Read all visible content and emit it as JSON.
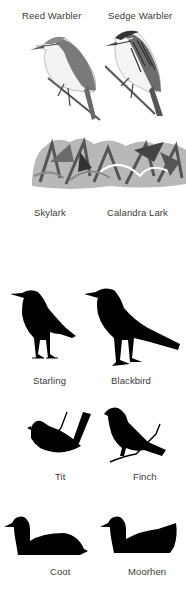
{
  "sections": [
    {
      "id": "warblers",
      "birds": [
        {
          "name": "Reed Warbler"
        },
        {
          "name": "Sedge Warbler"
        }
      ]
    },
    {
      "id": "larks",
      "birds": [
        {
          "name": "Skylark"
        },
        {
          "name": "Calandra Lark"
        }
      ]
    },
    {
      "id": "thrushes",
      "birds": [
        {
          "name": "Starling"
        },
        {
          "name": "Blackbird"
        }
      ]
    },
    {
      "id": "small-birds",
      "birds": [
        {
          "name": "Tit"
        },
        {
          "name": "Finch"
        }
      ]
    },
    {
      "id": "waterbirds",
      "birds": [
        {
          "name": "Coot"
        },
        {
          "name": "Moorhen"
        }
      ]
    }
  ],
  "colors": {
    "silhouette": "#000000",
    "label": "#3a3a3a",
    "background": "#ffffff"
  }
}
